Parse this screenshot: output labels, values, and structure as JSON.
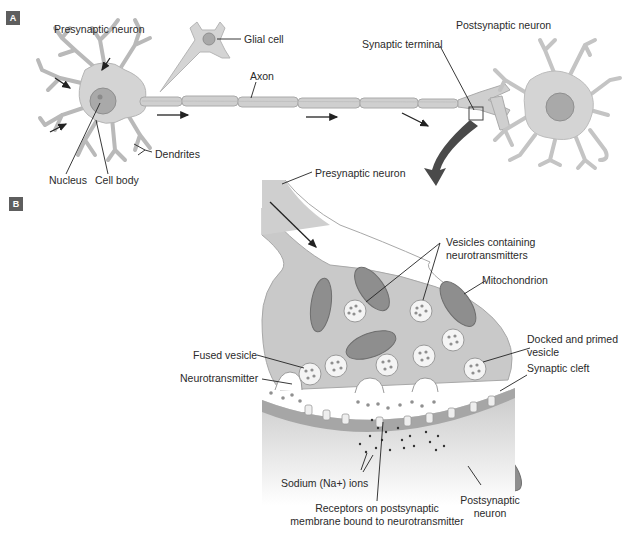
{
  "panels": {
    "a": {
      "badge": "A",
      "labels": {
        "presynaptic_neuron": "Presynaptic neuron",
        "glial_cell": "Glial cell",
        "axon": "Axon",
        "synaptic_terminal": "Synaptic terminal",
        "postsynaptic_neuron": "Postsynaptic neuron",
        "dendrites": "Dendrites",
        "nucleus": "Nucleus",
        "cell_body": "Cell body"
      }
    },
    "b": {
      "badge": "B",
      "labels": {
        "presynaptic_neuron": "Presynaptic neuron",
        "vesicles_line1": "Vesicles containing",
        "vesicles_line2": "neurotransmitters",
        "mitochondrion": "Mitochondrion",
        "docked_line1": "Docked and primed",
        "docked_line2": "vesicle",
        "synaptic_cleft": "Synaptic cleft",
        "fused_vesicle": "Fused vesicle",
        "neurotransmitter": "Neurotransmitter",
        "sodium_ions": "Sodium (Na+) ions",
        "receptors_line1": "Receptors on postsynaptic",
        "receptors_line2": "membrane bound to neurotransmitter",
        "postsynaptic_line1": "Postsynaptic",
        "postsynaptic_line2": "neuron"
      }
    }
  },
  "colors": {
    "cell_fill": "#d4d4d4",
    "cell_stroke": "#b5b5b5",
    "nucleus_fill": "#a9a9a9",
    "terminal_fill": "#c9c9c9",
    "mito_fill": "#8e8e8e",
    "membrane_dark": "#a6a6a6",
    "arrow": "#222222",
    "big_arrow": "#4a4a4a",
    "badge": "#5e5e5e"
  }
}
